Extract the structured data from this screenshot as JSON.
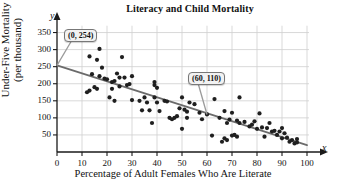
{
  "chart_data": {
    "type": "scatter",
    "title": "Literacy and Child Mortality",
    "xlabel": "Percentage of Adult Females Who Are Literate",
    "ylabel_line1": "Under-Five Mortality",
    "ylabel_line2": "(per thousand)",
    "x_axis_letter": "x",
    "y_axis_letter": "y",
    "xlim": [
      0,
      100
    ],
    "ylim": [
      0,
      375
    ],
    "xticks": [
      0,
      10,
      20,
      30,
      40,
      50,
      60,
      70,
      80,
      90,
      100
    ],
    "yticks": [
      50,
      100,
      150,
      200,
      250,
      300,
      350
    ],
    "grid": true,
    "legend": "none",
    "point_color": "#1f1f1f",
    "line_color": "#6b6b6b",
    "grid_color": "#cfcfcf",
    "axis_color": "#1a1a1a",
    "annotations": [
      {
        "label": "(0, 254)",
        "x": 0,
        "y": 254
      },
      {
        "label": "(60, 110)",
        "x": 60,
        "y": 110
      }
    ],
    "trend_line": {
      "name": "line of best fit",
      "x_start": 0,
      "y_start": 254,
      "x_end": 100,
      "y_end": 20,
      "slope": -2.34,
      "intercept": 254
    },
    "points": [
      [
        12,
        175
      ],
      [
        13,
        180
      ],
      [
        13,
        280
      ],
      [
        14,
        228
      ],
      [
        15,
        190
      ],
      [
        16,
        185
      ],
      [
        16,
        270
      ],
      [
        17,
        302
      ],
      [
        17,
        222
      ],
      [
        18,
        247
      ],
      [
        19,
        215
      ],
      [
        20,
        213
      ],
      [
        21,
        160
      ],
      [
        22,
        185
      ],
      [
        22,
        205
      ],
      [
        23,
        208
      ],
      [
        23,
        150
      ],
      [
        24,
        230
      ],
      [
        25,
        218
      ],
      [
        25,
        192
      ],
      [
        26,
        278
      ],
      [
        27,
        218
      ],
      [
        28,
        196
      ],
      [
        29,
        199
      ],
      [
        30,
        222
      ],
      [
        30,
        152
      ],
      [
        33,
        150
      ],
      [
        34,
        122
      ],
      [
        35,
        160
      ],
      [
        36,
        145
      ],
      [
        37,
        122
      ],
      [
        38,
        85
      ],
      [
        39,
        205
      ],
      [
        39,
        196
      ],
      [
        39,
        160
      ],
      [
        40,
        188
      ],
      [
        40,
        145
      ],
      [
        41,
        120
      ],
      [
        43,
        150
      ],
      [
        44,
        148
      ],
      [
        45,
        100
      ],
      [
        46,
        96
      ],
      [
        47,
        100
      ],
      [
        48,
        105
      ],
      [
        49,
        128
      ],
      [
        50,
        160
      ],
      [
        50,
        68
      ],
      [
        51,
        124
      ],
      [
        52,
        100
      ],
      [
        52,
        118
      ],
      [
        53,
        145
      ],
      [
        55,
        140
      ],
      [
        57,
        115
      ],
      [
        58,
        96
      ],
      [
        60,
        110
      ],
      [
        62,
        48
      ],
      [
        63,
        155
      ],
      [
        65,
        100
      ],
      [
        66,
        30
      ],
      [
        67,
        40
      ],
      [
        67,
        120
      ],
      [
        68,
        85
      ],
      [
        68,
        35
      ],
      [
        69,
        95
      ],
      [
        70,
        115
      ],
      [
        70,
        48
      ],
      [
        71,
        50
      ],
      [
        72,
        92
      ],
      [
        72,
        45
      ],
      [
        73,
        160
      ],
      [
        73,
        85
      ],
      [
        75,
        88
      ],
      [
        77,
        75
      ],
      [
        78,
        80
      ],
      [
        79,
        90
      ],
      [
        80,
        68
      ],
      [
        81,
        113
      ],
      [
        82,
        72
      ],
      [
        83,
        45
      ],
      [
        84,
        70
      ],
      [
        85,
        85
      ],
      [
        86,
        60
      ],
      [
        87,
        62
      ],
      [
        88,
        50
      ],
      [
        89,
        60
      ],
      [
        90,
        70
      ],
      [
        90,
        40
      ],
      [
        91,
        55
      ],
      [
        92,
        42
      ],
      [
        93,
        30
      ],
      [
        94,
        35
      ],
      [
        95,
        25
      ],
      [
        96,
        28
      ],
      [
        96,
        38
      ]
    ]
  }
}
